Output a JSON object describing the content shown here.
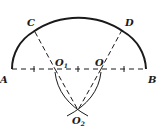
{
  "diagram": {
    "type": "geometry-construction",
    "points": {
      "A": {
        "label": "A",
        "x": 12,
        "y": 69
      },
      "B": {
        "label": "B",
        "x": 146,
        "y": 69
      },
      "C": {
        "label": "C",
        "x": 34,
        "y": 30
      },
      "D": {
        "label": "D",
        "x": 123,
        "y": 30
      },
      "O": {
        "label": "O",
        "x": 101,
        "y": 69
      },
      "O1": {
        "label": "O",
        "sub": "1",
        "x": 55,
        "y": 69
      },
      "O2": {
        "label": "O",
        "sub": "2",
        "x": 78,
        "y": 110
      }
    },
    "colors": {
      "stroke": "#1a1a1a"
    }
  }
}
